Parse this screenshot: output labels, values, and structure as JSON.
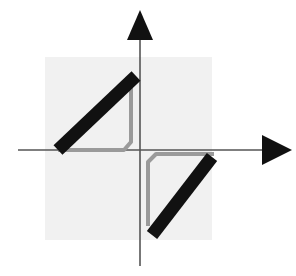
{
  "figure": {
    "width": 296,
    "height": 276
  },
  "colors": {
    "background": "#ffffff",
    "panel": "#f0f0f0",
    "panel_edge": "#e4e4e4",
    "axis": "#555555",
    "arrowhead": "#111111",
    "curve_primary": "#111111",
    "curve_secondary": "#9a9a9a"
  },
  "axes": {
    "origin": {
      "x": 140,
      "y": 150
    },
    "x_axis": {
      "name": "horizontal-axis",
      "start_x": 18,
      "end_x": 264,
      "y": 150,
      "stroke_width": 1.6,
      "arrow": {
        "name": "x-axis-arrowhead",
        "tip_x": 292,
        "tip_y": 150,
        "back_x": 262,
        "half_height": 15
      }
    },
    "y_axis": {
      "name": "vertical-axis",
      "start_y": 266,
      "end_y": 36,
      "x": 140,
      "stroke_width": 1.6,
      "arrow": {
        "name": "y-axis-arrowhead",
        "tip_x": 140,
        "tip_y": 10,
        "back_y": 40,
        "half_width": 13
      }
    }
  },
  "panel": {
    "name": "plot-background-square",
    "x": 45,
    "y": 57,
    "width": 167,
    "height": 183,
    "fill": "#f1f1f1"
  },
  "chart_data": {
    "type": "line",
    "xlabel": "",
    "ylabel": "",
    "grid": false,
    "legend": null,
    "annotations": [],
    "series": [
      {
        "name": "upper-branch-black",
        "role": "primary",
        "color": "#111111",
        "stroke_width": 13,
        "points": [
          {
            "x": 58,
            "y": 150
          },
          {
            "x": 136,
            "y": 76
          }
        ],
        "note": "Thick black diagonal in the second quadrant, rising left-to-right, starting on the x-axis and ending just left of the y-axis."
      },
      {
        "name": "lower-branch-black",
        "role": "primary",
        "color": "#111111",
        "stroke_width": 13,
        "points": [
          {
            "x": 152,
            "y": 235
          },
          {
            "x": 212,
            "y": 157
          }
        ],
        "note": "Thick black diagonal in the fourth quadrant, parallel to the upper branch, offset down and to the right."
      },
      {
        "name": "upper-connector-gray",
        "role": "secondary",
        "color": "#9a9a9a",
        "stroke_width": 4,
        "points": [
          {
            "x": 131,
            "y": 74
          },
          {
            "x": 131,
            "y": 142
          },
          {
            "x": 124,
            "y": 150
          },
          {
            "x": 58,
            "y": 150
          }
        ],
        "note": "Thin gray vertical drop just left of the y-axis, rounding into a horizontal run back along the x-axis to the foot of the upper black branch."
      },
      {
        "name": "lower-connector-gray",
        "role": "secondary",
        "color": "#9a9a9a",
        "stroke_width": 4,
        "points": [
          {
            "x": 148,
            "y": 226
          },
          {
            "x": 148,
            "y": 162
          },
          {
            "x": 156,
            "y": 154
          },
          {
            "x": 214,
            "y": 154
          }
        ],
        "note": "Mirror image of the upper connector: gray vertical just right of the y-axis rising to a horizontal run along the x-axis to the head of the lower black branch."
      }
    ]
  }
}
